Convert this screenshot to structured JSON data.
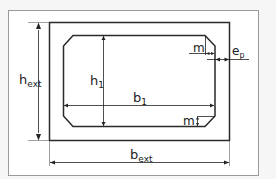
{
  "diagram": {
    "colors": {
      "background": "#f6f6f6",
      "frame": "#9a9a9a",
      "stroke": "#2a2a2a",
      "fill": "#ffffff"
    },
    "labels": {
      "h_ext": {
        "main": "h",
        "sub": "ext"
      },
      "h_1": {
        "main": "h",
        "sub": "1"
      },
      "b_1": {
        "main": "b",
        "sub": "1"
      },
      "b_ext": {
        "main": "b",
        "sub": "ext"
      },
      "e_p": {
        "main": "e",
        "sub": "p"
      },
      "m_top": {
        "main": "m"
      },
      "m_bottom": {
        "main": "m"
      }
    }
  }
}
